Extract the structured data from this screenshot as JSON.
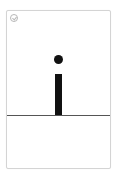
{
  "card": {
    "glyph": "i",
    "status_icon": "check-circle-icon",
    "colors": {
      "glyph": "#111111",
      "baseline": "#555555",
      "border": "#d4d4d4"
    }
  }
}
